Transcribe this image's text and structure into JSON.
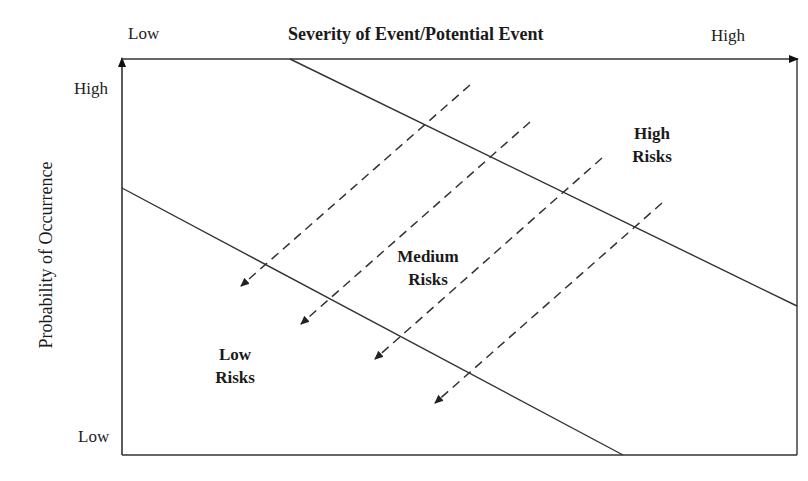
{
  "diagram": {
    "x_axis": {
      "title": "Severity of Event/Potential Event",
      "low_label": "Low",
      "high_label": "High"
    },
    "y_axis": {
      "title": "Probability of Occurrence",
      "low_label": "Low",
      "high_label": "High"
    },
    "regions": {
      "low": {
        "line1": "Low",
        "line2": "Risks"
      },
      "medium": {
        "line1": "Medium",
        "line2": "Risks"
      },
      "high": {
        "line1": "High",
        "line2": "Risks"
      }
    },
    "boundaries": [
      {
        "name": "low-medium-boundary",
        "style": "solid"
      },
      {
        "name": "medium-high-boundary",
        "style": "solid"
      }
    ],
    "arrows": {
      "count": 4,
      "style": "dashed",
      "direction": "toward lower-left (reducing risk)"
    },
    "colors": {
      "line": "#333333",
      "text": "#1a1a1a",
      "background": "#ffffff"
    }
  }
}
